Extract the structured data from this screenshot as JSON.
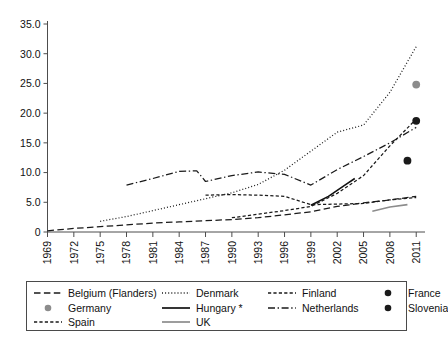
{
  "chart_data": {
    "type": "line",
    "title": "",
    "subtitle": "",
    "xlabel": "",
    "ylabel": "",
    "xlim": [
      1969,
      2012
    ],
    "ylim": [
      0,
      35
    ],
    "grid": false,
    "legend_position": "bottom",
    "y_ticks": [
      "0",
      "5.0",
      "10.0",
      "15.0",
      "20.0",
      "25.0",
      "30.0",
      "35.0"
    ],
    "y_tick_values": [
      0,
      5,
      10,
      15,
      20,
      25,
      30,
      35
    ],
    "x_ticks": [
      "1969",
      "1972",
      "1975",
      "1978",
      "1981",
      "1984",
      "1987",
      "1990",
      "1993",
      "1996",
      "1999",
      "2002",
      "2005",
      "2008",
      "2011"
    ],
    "x_tick_values": [
      1969,
      1972,
      1975,
      1978,
      1981,
      1984,
      1987,
      1990,
      1993,
      1996,
      1999,
      2002,
      2005,
      2008,
      2011
    ],
    "series": [
      {
        "name": "Belgium (Flanders)",
        "style": "long-dash",
        "color": "#1a1a1a",
        "marker": "none",
        "x": [
          1969,
          1972,
          1975,
          1978,
          1981,
          1984,
          1987,
          1990,
          1993,
          1996,
          1999,
          2002,
          2005,
          2008,
          2011
        ],
        "values": [
          0.2,
          0.6,
          0.9,
          1.2,
          1.5,
          1.7,
          1.9,
          2.1,
          2.4,
          2.9,
          3.4,
          4.3,
          4.9,
          5.4,
          6.0
        ]
      },
      {
        "name": "Denmark",
        "style": "dotted",
        "color": "#1a1a1a",
        "marker": "none",
        "x": [
          1975,
          1978,
          1981,
          1984,
          1987,
          1990,
          1993,
          1996,
          1999,
          2002,
          2005,
          2008,
          2011
        ],
        "values": [
          1.8,
          2.6,
          3.6,
          4.6,
          5.6,
          6.6,
          8.0,
          10.4,
          13.6,
          16.8,
          18.0,
          23.5,
          31.2
        ]
      },
      {
        "name": "Finland",
        "style": "short-dash",
        "color": "#1a1a1a",
        "marker": "none",
        "x": [
          1987,
          1990,
          1993,
          1996,
          1999,
          2002,
          2005,
          2008,
          2011
        ],
        "values": [
          6.2,
          6.3,
          6.2,
          6.0,
          4.6,
          4.7,
          4.8,
          5.4,
          5.8
        ]
      },
      {
        "name": "France",
        "style": "marker-only",
        "color": "#1a1a1a",
        "marker": "dot-black",
        "x": [
          2010
        ],
        "values": [
          12.0
        ]
      },
      {
        "name": "Germany",
        "style": "marker-only",
        "color": "#8c8c8c",
        "marker": "dot-gray",
        "x": [
          2011
        ],
        "values": [
          24.8
        ]
      },
      {
        "name": "Hungary *",
        "style": "solid",
        "color": "#111111",
        "marker": "none",
        "x": [
          1999,
          2001,
          2003,
          2004
        ],
        "values": [
          4.5,
          6.0,
          8.0,
          9.0
        ]
      },
      {
        "name": "Netherlands",
        "style": "dash-dot",
        "color": "#1a1a1a",
        "marker": "none",
        "x": [
          1978,
          1981,
          1984,
          1986,
          1987,
          1990,
          1993,
          1996,
          1999,
          2002,
          2005,
          2008,
          2011
        ],
        "values": [
          7.9,
          9.0,
          10.2,
          10.3,
          8.5,
          9.5,
          10.1,
          9.7,
          7.9,
          10.5,
          12.7,
          15.0,
          17.6
        ]
      },
      {
        "name": "Slovenia",
        "style": "marker-only",
        "color": "#1a1a1a",
        "marker": "dot-black",
        "x": [
          2011
        ],
        "values": [
          18.7
        ]
      },
      {
        "name": "Spain",
        "style": "short-dash",
        "color": "#1a1a1a",
        "marker": "none",
        "x": [
          1990,
          1993,
          1996,
          1999,
          2002,
          2005,
          2008,
          2011
        ],
        "values": [
          2.4,
          3.0,
          3.6,
          4.3,
          6.5,
          9.5,
          14.5,
          19.0
        ]
      },
      {
        "name": "UK",
        "style": "solid",
        "color": "#8c8c8c",
        "marker": "none",
        "x": [
          2006,
          2008,
          2010
        ],
        "values": [
          3.5,
          4.2,
          4.6
        ]
      }
    ]
  },
  "legend": {
    "entries": [
      {
        "label": "Belgium (Flanders)",
        "mark": "long-dash-line",
        "color": "#1a1a1a"
      },
      {
        "label": "Denmark",
        "mark": "dotted-line",
        "color": "#1a1a1a"
      },
      {
        "label": "Finland",
        "mark": "short-dash-line",
        "color": "#1a1a1a"
      },
      {
        "label": "France",
        "mark": "black-dot-marker",
        "color": "#1a1a1a"
      },
      {
        "label": "Germany",
        "mark": "gray-dot-marker",
        "color": "#8c8c8c"
      },
      {
        "label": "Hungary *",
        "mark": "solid-black-line",
        "color": "#111111"
      },
      {
        "label": "Netherlands",
        "mark": "dash-dot-line",
        "color": "#1a1a1a"
      },
      {
        "label": "Slovenia",
        "mark": "black-dot-marker",
        "color": "#1a1a1a"
      },
      {
        "label": "Spain",
        "mark": "short-dash-line",
        "color": "#1a1a1a"
      },
      {
        "label": "UK",
        "mark": "solid-gray-line",
        "color": "#8c8c8c"
      }
    ]
  }
}
